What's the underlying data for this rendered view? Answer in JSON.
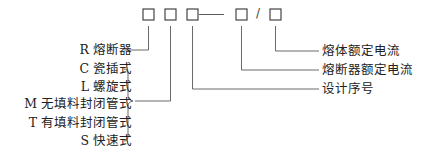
{
  "diagram": {
    "code_boxes": [
      "box-1",
      "box-2",
      "box-3",
      "box-4",
      "box-5"
    ],
    "separator": "/",
    "left_labels": {
      "r": "R 熔断器",
      "c": "C 瓷插式",
      "l": "L 螺旋式",
      "m": "M 无填料封闭管式",
      "t": "T 有填料封闭管式",
      "s": "S 快速式"
    },
    "right_labels": {
      "fuse_element_current": "熔体额定电流",
      "fuse_rated_current": "熔断器额定电流",
      "design_serial": "设计序号"
    },
    "line_color": "#333333"
  }
}
